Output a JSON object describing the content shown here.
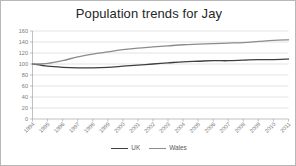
{
  "chart_data": {
    "type": "line",
    "title": "Population trends for Jay",
    "xlabel": "",
    "ylabel": "",
    "ylim": [
      0,
      160
    ],
    "ytick_step": 20,
    "yticks": [
      "0",
      "20",
      "40",
      "60",
      "80",
      "100",
      "120",
      "140",
      "160"
    ],
    "grid": true,
    "legend_position": "bottom",
    "categories": [
      "1994",
      "1995",
      "1996",
      "1997",
      "1998",
      "1999",
      "2000",
      "2001",
      "2002",
      "2003",
      "2004",
      "2005",
      "2006",
      "2007",
      "2008",
      "2009",
      "2010",
      "2011"
    ],
    "series": [
      {
        "name": "UK",
        "color": "#3f3f3f",
        "values": [
          100,
          96,
          94,
          93,
          93,
          94,
          96,
          98,
          100,
          102,
          104,
          105,
          106,
          106,
          107,
          108,
          108,
          109
        ]
      },
      {
        "name": "Wales",
        "color": "#8c8c8c",
        "values": [
          100,
          101,
          106,
          113,
          118,
          122,
          126,
          129,
          131,
          133,
          135,
          136,
          137,
          138,
          139,
          141,
          143,
          144
        ]
      }
    ]
  },
  "legend": {
    "entries": [
      {
        "label": "UK",
        "color": "#3f3f3f"
      },
      {
        "label": "Wales",
        "color": "#8c8c8c"
      }
    ]
  },
  "colors": {
    "background": "#ffffff",
    "frame_border": "#b8b8b8",
    "gridline": "#d2d2d2",
    "axis": "#a6a6a6",
    "tick_text": "#7a7a7a",
    "title_text": "#262626"
  }
}
